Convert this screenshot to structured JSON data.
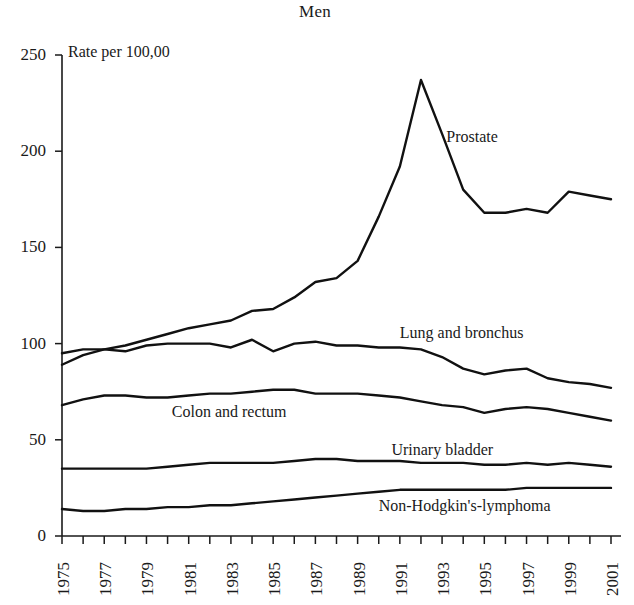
{
  "chart_data": {
    "type": "line",
    "title": "Men",
    "ylabel": "Rate per 100,00",
    "xlabel": "",
    "ylim": [
      0,
      250
    ],
    "yticks": [
      0,
      50,
      100,
      150,
      200,
      250
    ],
    "ytick_labels": [
      "0",
      "50",
      "100",
      "150",
      "200",
      "250"
    ],
    "grid": false,
    "legend_position": "inline-annotations",
    "x": [
      1975,
      1976,
      1977,
      1978,
      1979,
      1980,
      1981,
      1982,
      1983,
      1984,
      1985,
      1986,
      1987,
      1988,
      1989,
      1990,
      1991,
      1992,
      1993,
      1994,
      1995,
      1996,
      1997,
      1998,
      1999,
      2000,
      2001
    ],
    "xtick_labels": [
      "1975",
      "1977",
      "1979",
      "1981",
      "1983",
      "1985",
      "1987",
      "1989",
      "1991",
      "1993",
      "1995",
      "1997",
      "1999",
      "2001"
    ],
    "xtick_values": [
      1975,
      1977,
      1979,
      1981,
      1983,
      1985,
      1987,
      1989,
      1991,
      1993,
      1995,
      1997,
      1999,
      2001
    ],
    "annotations": [
      {
        "text": "Prostate",
        "x": 1993.2,
        "y": 207
      },
      {
        "text": "Lung and bronchus",
        "x": 1991.0,
        "y": 105
      },
      {
        "text": "Colon and rectum",
        "x": 1980.2,
        "y": 64
      },
      {
        "text": "Urinary bladder",
        "x": 1990.6,
        "y": 44
      },
      {
        "text": "Non-Hodgkin's-lymphoma",
        "x": 1990.0,
        "y": 15
      }
    ],
    "series": [
      {
        "name": "Prostate",
        "color": "#111111",
        "values": [
          89,
          94,
          97,
          99,
          102,
          105,
          108,
          110,
          112,
          117,
          118,
          124,
          132,
          134,
          143,
          166,
          192,
          237,
          209,
          180,
          168,
          168,
          170,
          168,
          179,
          177,
          175
        ]
      },
      {
        "name": "Lung and bronchus",
        "color": "#111111",
        "values": [
          95,
          97,
          97,
          96,
          99,
          100,
          100,
          100,
          98,
          102,
          96,
          100,
          101,
          99,
          99,
          98,
          98,
          97,
          93,
          87,
          84,
          86,
          87,
          82,
          80,
          79,
          77
        ]
      },
      {
        "name": "Colon and rectum",
        "color": "#111111",
        "values": [
          68,
          71,
          73,
          73,
          72,
          72,
          73,
          74,
          74,
          75,
          76,
          76,
          74,
          74,
          74,
          73,
          72,
          70,
          68,
          67,
          64,
          66,
          67,
          66,
          64,
          62,
          60
        ]
      },
      {
        "name": "Urinary bladder",
        "color": "#111111",
        "values": [
          35,
          35,
          35,
          35,
          35,
          36,
          37,
          38,
          38,
          38,
          38,
          39,
          40,
          40,
          39,
          39,
          39,
          38,
          38,
          38,
          37,
          37,
          38,
          37,
          38,
          37,
          36
        ]
      },
      {
        "name": "Non-Hodgkin's-lymphoma",
        "color": "#111111",
        "values": [
          14,
          13,
          13,
          14,
          14,
          15,
          15,
          16,
          16,
          17,
          18,
          19,
          20,
          21,
          22,
          23,
          24,
          24,
          24,
          24,
          24,
          24,
          25,
          25,
          25,
          25,
          25
        ]
      }
    ]
  }
}
